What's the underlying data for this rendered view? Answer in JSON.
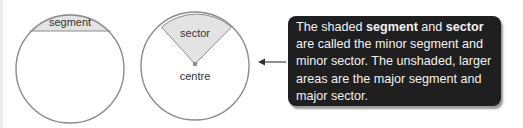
{
  "diagram": {
    "segment_label": "segment",
    "sector_label": "sector",
    "centre_label": "centre",
    "colors": {
      "shade": "#e3e3e3",
      "outline": "#8c8c8c",
      "callout_bg": "#1f1f1f",
      "callout_text": "#f2f2f2"
    }
  },
  "callout": {
    "t1": "The shaded ",
    "b1": "segment",
    "t2": " and ",
    "b2": "sector",
    "t3": " are called the minor segment and minor sector. The unshaded, larger areas are the major segment and major sector."
  }
}
